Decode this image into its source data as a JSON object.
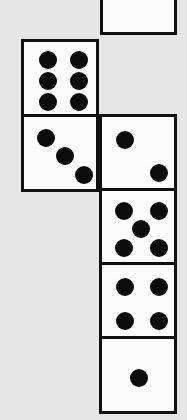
{
  "scene": {
    "title": "Dice chain",
    "description": "Chain of square dice faces arranged in an L-shape on a light gray background",
    "width": 187,
    "height": 420,
    "background_color": "#e9e9e9",
    "face_fill_color": "#ffffff",
    "border_color": "#111111",
    "pip_color": "#0c0c0c",
    "border_width": 3
  },
  "dice": [
    {
      "name": "die-top-partial",
      "value": 0,
      "value_label": "cut off",
      "x": 100,
      "y": -42,
      "size": 77,
      "pips": []
    },
    {
      "name": "die-six",
      "value": 6,
      "value_label": "6",
      "x": 21,
      "y": 39,
      "size": 78,
      "pips": [
        {
          "cx": 24,
          "cy": 18,
          "r": 9
        },
        {
          "cx": 55,
          "cy": 18,
          "r": 9
        },
        {
          "cx": 24,
          "cy": 39,
          "r": 9
        },
        {
          "cx": 55,
          "cy": 39,
          "r": 9
        },
        {
          "cx": 24,
          "cy": 60,
          "r": 9
        },
        {
          "cx": 55,
          "cy": 60,
          "r": 9
        }
      ]
    },
    {
      "name": "die-three",
      "value": 3,
      "value_label": "3",
      "x": 21,
      "y": 114,
      "size": 78,
      "pips": [
        {
          "cx": 22,
          "cy": 21,
          "r": 9
        },
        {
          "cx": 41,
          "cy": 39,
          "r": 9
        },
        {
          "cx": 60,
          "cy": 58,
          "r": 9
        }
      ]
    },
    {
      "name": "die-two",
      "value": 2,
      "value_label": "2",
      "x": 99,
      "y": 114,
      "size": 78,
      "pips": [
        {
          "cx": 23,
          "cy": 23,
          "r": 9
        },
        {
          "cx": 57,
          "cy": 56,
          "r": 9
        }
      ]
    },
    {
      "name": "die-five",
      "value": 5,
      "value_label": "5",
      "x": 99,
      "y": 188,
      "size": 78,
      "pips": [
        {
          "cx": 22,
          "cy": 20,
          "r": 9
        },
        {
          "cx": 57,
          "cy": 20,
          "r": 9
        },
        {
          "cx": 39,
          "cy": 38,
          "r": 9
        },
        {
          "cx": 22,
          "cy": 57,
          "r": 9
        },
        {
          "cx": 57,
          "cy": 57,
          "r": 9
        }
      ]
    },
    {
      "name": "die-four",
      "value": 4,
      "value_label": "4",
      "x": 99,
      "y": 262,
      "size": 78,
      "pips": [
        {
          "cx": 23,
          "cy": 22,
          "r": 9
        },
        {
          "cx": 57,
          "cy": 22,
          "r": 9
        },
        {
          "cx": 23,
          "cy": 56,
          "r": 9
        },
        {
          "cx": 57,
          "cy": 56,
          "r": 9
        }
      ]
    },
    {
      "name": "die-one",
      "value": 1,
      "value_label": "1",
      "x": 99,
      "y": 336,
      "size": 78,
      "pips": [
        {
          "cx": 37,
          "cy": 39,
          "r": 9
        }
      ]
    }
  ]
}
